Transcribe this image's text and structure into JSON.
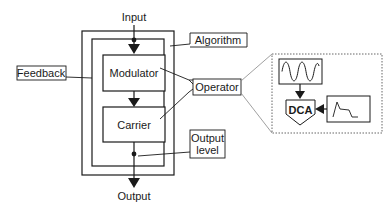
{
  "diagram": {
    "labels": {
      "input": "Input",
      "output": "Output",
      "algorithm": "Algorithm",
      "feedback": "Feedback",
      "modulator": "Modulator",
      "carrier": "Carrier",
      "operator": "Operator",
      "output_level_line1": "Output",
      "output_level_line2": "level",
      "dca": "DCA"
    },
    "icons": {
      "oscillator": "sine-wave-icon",
      "envelope": "envelope-icon"
    },
    "colors": {
      "stroke": "#1a1a1a",
      "background": "#ffffff",
      "dotted": "#555555"
    }
  }
}
